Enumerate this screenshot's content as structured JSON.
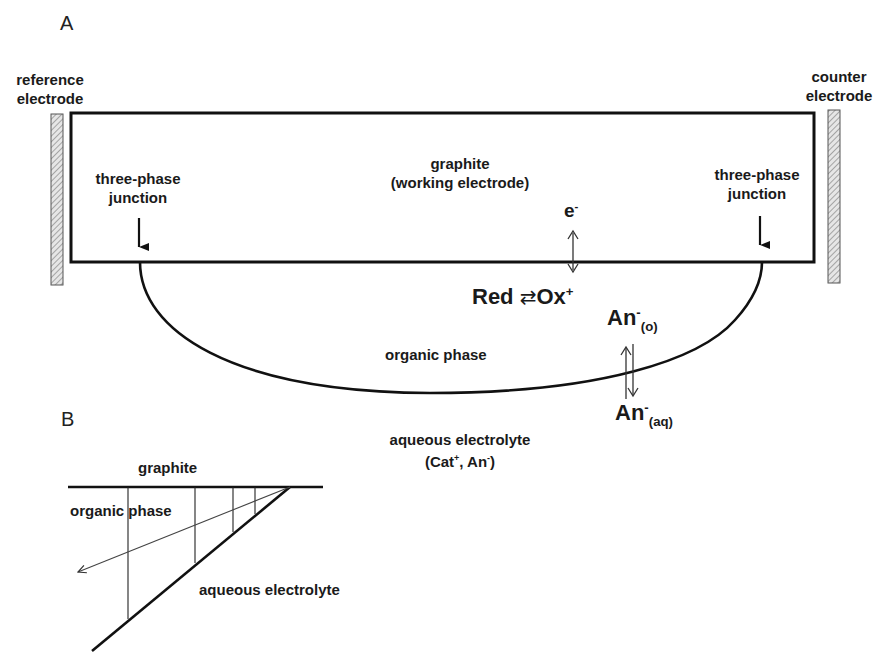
{
  "panel_a": {
    "panel_label": "A",
    "reference_electrode": {
      "line1": "reference",
      "line2": "electrode"
    },
    "counter_electrode": {
      "line1": "counter",
      "line2": "electrode"
    },
    "working_electrode": {
      "line1": "graphite",
      "line2": "(working electrode)"
    },
    "junction_left": {
      "line1": "three-phase",
      "line2": "junction"
    },
    "junction_right": {
      "line1": "three-phase",
      "line2": "junction"
    },
    "electron": {
      "base": "e",
      "sup": "-"
    },
    "redox": {
      "red": "Red",
      "arrow": "⇄",
      "ox": "Ox",
      "ox_sup": "+"
    },
    "anion_organic": {
      "base": "An",
      "sup": "-",
      "sub": "(o)"
    },
    "anion_aqueous": {
      "base": "An",
      "sup": "-",
      "sub": "(aq)"
    },
    "organic_phase": "organic phase",
    "aqueous_electrolyte": {
      "line1": "aqueous electrolyte",
      "line2_open": "(Cat",
      "cat_sup": "+",
      "line2_mid": ", An",
      "an_sup": "-",
      "line2_close": ")"
    }
  },
  "panel_b": {
    "panel_label": "B",
    "graphite": "graphite",
    "organic_phase": "organic phase",
    "aqueous_electrolyte": "aqueous electrolyte"
  },
  "colors": {
    "line": "#111111",
    "hatch": "#888888",
    "background": "#ffffff"
  }
}
